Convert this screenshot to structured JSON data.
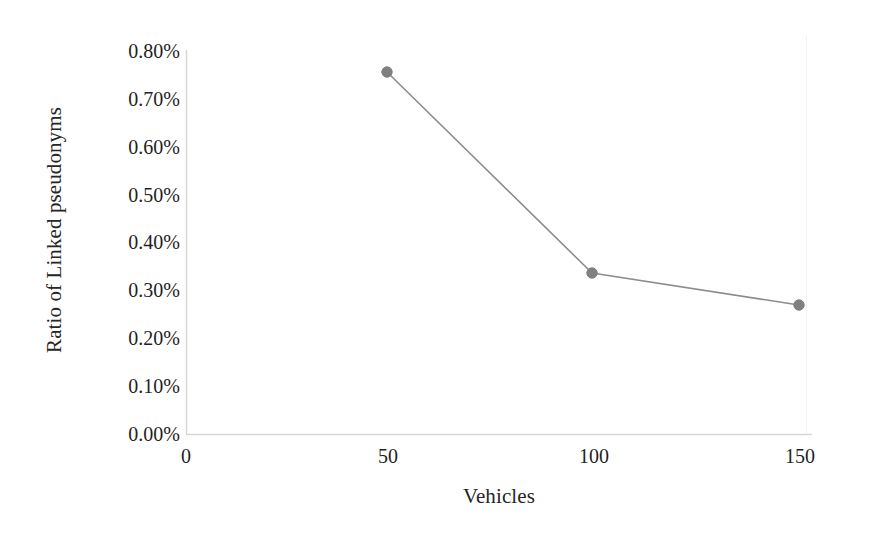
{
  "chart_data": {
    "type": "line",
    "title": "",
    "subtitle": "",
    "xlabel": "Vehicles",
    "ylabel": "Ratio of Linked pseudonyms",
    "x": [
      50,
      100,
      150
    ],
    "values": [
      0.75,
      0.33,
      0.26
    ],
    "series": [
      {
        "name": "Ratio of Linked pseudonyms",
        "x": [
          50,
          100,
          150
        ],
        "values": [
          0.75,
          0.33,
          0.26
        ],
        "value_labels": [
          "0.75%",
          "0.33%",
          "0.26%"
        ],
        "color": "#808080",
        "marker": "circle"
      }
    ],
    "xlim": [
      0,
      150
    ],
    "ylim": [
      0,
      0.8
    ],
    "xticks": [
      0,
      50,
      100,
      150
    ],
    "xtick_labels": [
      "0",
      "50",
      "100",
      "150"
    ],
    "yticks": [
      0.8,
      0.7,
      0.6,
      0.5,
      0.4,
      0.3,
      0.2,
      0.1,
      0
    ],
    "ytick_labels": [
      "0.80%",
      "0.70%",
      "0.60%",
      "0.50%",
      "0.40%",
      "0.30%",
      "0.20%",
      "0.10%",
      "0.00%"
    ],
    "grid": false,
    "legend": false,
    "legend_position": "none",
    "annotations": [],
    "colors": {
      "line": "#8c8c8c",
      "marker": "#808080",
      "axis": "#d4d4d4",
      "text": "#262626",
      "background": "#ffffff"
    }
  },
  "axes": {
    "y_title": "Ratio of Linked pseudonyms",
    "x_title": "Vehicles",
    "y_labels": [
      {
        "text": "0.80%",
        "y": 51
      },
      {
        "text": "0.70%",
        "y": 99
      },
      {
        "text": "0.60%",
        "y": 147
      },
      {
        "text": "0.50%",
        "y": 195
      },
      {
        "text": "0.40%",
        "y": 242
      },
      {
        "text": "0.30%",
        "y": 290
      },
      {
        "text": "0.20%",
        "y": 338
      },
      {
        "text": "0.10%",
        "y": 386
      },
      {
        "text": "0.00%",
        "y": 434
      }
    ],
    "x_labels": [
      {
        "text": "0",
        "x": 186
      },
      {
        "text": "50",
        "x": 388
      },
      {
        "text": "100",
        "x": 594
      },
      {
        "text": "150",
        "x": 800
      }
    ]
  },
  "points": [
    {
      "label": "0.75%",
      "cx": 387,
      "cy": 72
    },
    {
      "label": "0.33%",
      "cx": 592,
      "cy": 273
    },
    {
      "label": "0.26%",
      "cx": 799,
      "cy": 305
    }
  ]
}
